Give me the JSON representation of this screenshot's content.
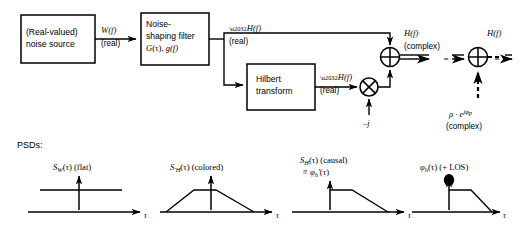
{
  "diagram": {
    "blocks": [
      {
        "id": "noise-source",
        "line1": "(Real-valued)",
        "line2": "noise source"
      },
      {
        "id": "noise-shaping-filter",
        "line1": "Noise-",
        "line2": "shaping filter",
        "line3_sym": "G",
        "line3_arg": "(τ), ",
        "line3_sym2": "g",
        "line3_arg2": "(f)"
      },
      {
        "id": "hilbert-transform",
        "line1": "Hilbert",
        "line2": "transform"
      }
    ],
    "signals": {
      "w_of_f": "W(f)",
      "w_real": "(real)",
      "h_prime_top": "H(f)",
      "h_prime_top_real": "(real)",
      "h_prime_hilbert": "H(f)",
      "h_prime_hilbert_real": "(real)",
      "h_complex": "H(f)",
      "h_complex_note": "(complex)",
      "h_out": "H(f)",
      "minus_j": "–j",
      "equals": "=",
      "rho_term": "ρ · e",
      "rho_exp": "jφ",
      "rho_exp_sub": "p",
      "rho_note": "(complex)"
    },
    "nodes": [
      {
        "id": "multiplier",
        "glyph": "cross"
      },
      {
        "id": "summing-junction-1",
        "glyph": "plus"
      },
      {
        "id": "summing-junction-2",
        "glyph": "plus"
      }
    ]
  },
  "psds": {
    "heading": "PSDs:",
    "axis_label": "τ",
    "plots": [
      {
        "id": "psd-sw-flat",
        "sym": "S",
        "sub": "W",
        "arg": "(τ)",
        "note": "(flat)",
        "shape": "flat"
      },
      {
        "id": "psd-sh-colored",
        "sym": "S",
        "sub": "′H",
        "arg": "(τ)",
        "note": "(colored)",
        "shape": "trapezoid"
      },
      {
        "id": "psd-sh-causal",
        "sym": "S",
        "sub": "H",
        "arg": "(τ)",
        "note": "(causal)",
        "line2_eq": "≡ ",
        "line2_sym": "φ",
        "line2_sub": "h",
        "line2_prime": "′",
        "line2_arg": "(τ)",
        "shape": "causal"
      },
      {
        "id": "psd-phi-los",
        "sym": "φ",
        "sub": "h",
        "arg": "(τ)",
        "note": "(+ LOS)",
        "shape": "causal-los"
      }
    ]
  }
}
